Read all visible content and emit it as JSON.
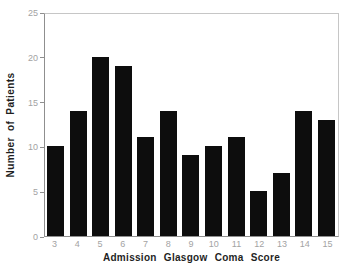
{
  "chart_data": {
    "type": "bar",
    "categories": [
      "3",
      "4",
      "5",
      "6",
      "7",
      "8",
      "9",
      "10",
      "11",
      "12",
      "13",
      "14",
      "15"
    ],
    "values": [
      10,
      14,
      20,
      19,
      11,
      14,
      9,
      10,
      11,
      5,
      7,
      14,
      13
    ],
    "title": "",
    "xlabel": "Admission Glasgow Coma Score",
    "ylabel": "Number of Patients",
    "ylim": [
      0,
      25
    ],
    "yticks": [
      0,
      5,
      10,
      15,
      20,
      25
    ],
    "grid": false,
    "legend": "none"
  },
  "colors": {
    "background": "#ffffff",
    "bar": "#0d0d0d",
    "axis_line": "#8f8f8f",
    "frame_line": "#c6c6c6",
    "tick_label": "#a3a3a3",
    "axis_title": "#1f1f1f"
  }
}
